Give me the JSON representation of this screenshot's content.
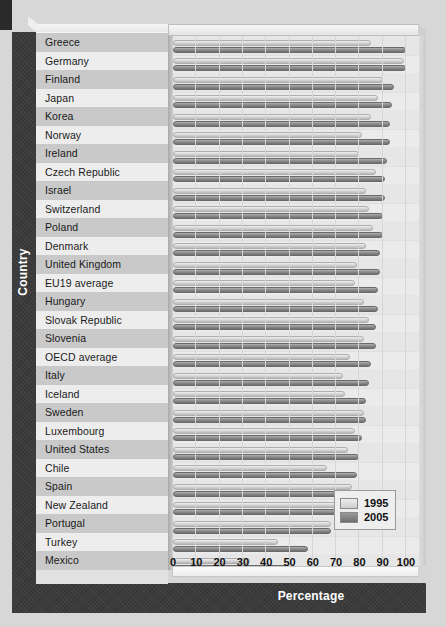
{
  "chart_data": {
    "type": "bar",
    "orientation": "horizontal",
    "title": "",
    "xlabel": "Percentage",
    "ylabel": "Country",
    "xlim": [
      0,
      100
    ],
    "xticks": [
      "0",
      "10",
      "20",
      "30",
      "40",
      "50",
      "60",
      "70",
      "80",
      "90",
      "100"
    ],
    "grid": true,
    "legend_position": "bottom-right",
    "categories": [
      "Greece",
      "Germany",
      "Finland",
      "Japan",
      "Korea",
      "Norway",
      "Ireland",
      "Czech Republic",
      "Israel",
      "Switzerland",
      "Poland",
      "Denmark",
      "United Kingdom",
      "EU19 average",
      "Hungary",
      "Slovak Republic",
      "Slovenia",
      "OECD average",
      "Italy",
      "Iceland",
      "Sweden",
      "Luxembourg",
      "United States",
      "Chile",
      "Spain",
      "New Zealand",
      "Portugal",
      "Turkey",
      "Mexico"
    ],
    "series": [
      {
        "name": "1995",
        "color": "#d7d7d7",
        "values": [
          85,
          99,
          90,
          88,
          85,
          81,
          80,
          87,
          83,
          84,
          86,
          83,
          79,
          78,
          82,
          84,
          82,
          76,
          73,
          74,
          82,
          78,
          75,
          66,
          77,
          71,
          68,
          45,
          33
        ]
      },
      {
        "name": "2005",
        "color": "#7d7d7d",
        "values": [
          100,
          100,
          95,
          94,
          93,
          93,
          92,
          91,
          91,
          90,
          90,
          89,
          89,
          88,
          88,
          87,
          87,
          85,
          84,
          83,
          83,
          81,
          80,
          79,
          79,
          78,
          68,
          58,
          50
        ]
      }
    ]
  },
  "axis": {
    "x_title": "Percentage",
    "y_title": "Country"
  },
  "legend": {
    "items": [
      {
        "label": "1995",
        "swatch": "light-gray-swatch"
      },
      {
        "label": "2005",
        "swatch": "dark-gray-swatch"
      }
    ]
  }
}
